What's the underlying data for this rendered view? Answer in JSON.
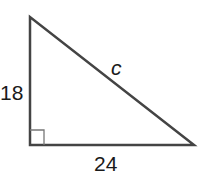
{
  "diagram": {
    "type": "right-triangle",
    "labels": {
      "left_leg": "18",
      "bottom_leg": "24",
      "hypotenuse": "c"
    },
    "colors": {
      "stroke": "#444444",
      "right_angle_marker": "#777777",
      "text": "#1a1a1a"
    }
  }
}
